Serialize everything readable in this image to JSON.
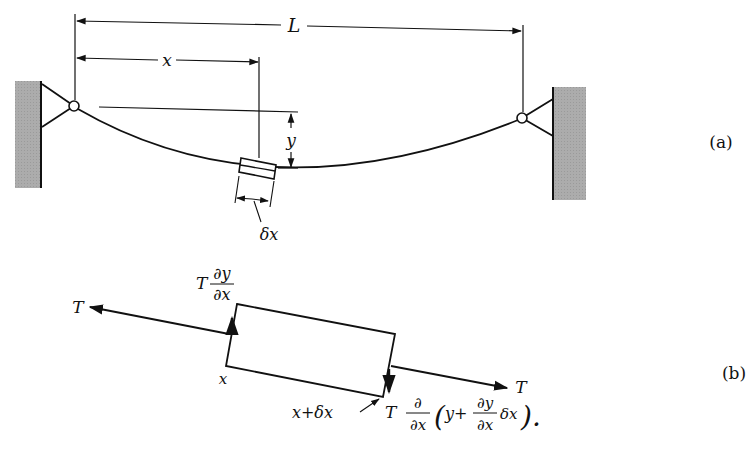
{
  "figure": {
    "panel_a": {
      "tag": "(a)",
      "dimension_span": "L",
      "dimension_position": "x",
      "dimension_deflection": "y",
      "element_width": "δx"
    },
    "panel_b": {
      "tag": "(b)",
      "tension_left": "T",
      "tension_right": "T",
      "vertical_force_left": {
        "coef": "T",
        "num": "∂y",
        "den": "∂x"
      },
      "left_edge_label": "x",
      "right_edge_label": "x+δx",
      "vertical_force_right": {
        "coef": "T",
        "num": "∂",
        "den": "∂x",
        "paren_open": "(",
        "inner_y": "y+",
        "inner_num": "∂y",
        "inner_den": "∂x",
        "inner_dx": "δx",
        "paren_close": ").",
        "full_text": "T ∂/∂x (y + ∂y/∂x δx)"
      }
    },
    "colors": {
      "ink": "#111111",
      "wall": "#a9a9a9"
    }
  }
}
